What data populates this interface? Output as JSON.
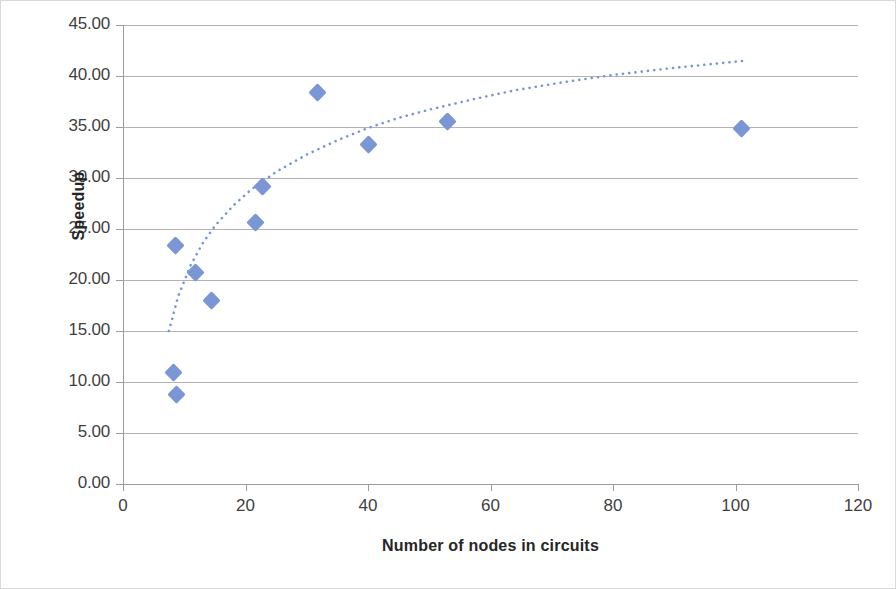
{
  "chart_data": {
    "type": "scatter",
    "title": "",
    "xlabel": "Number of nodes in circuits",
    "ylabel": "Speedup",
    "xlim": [
      0,
      120
    ],
    "ylim": [
      0,
      45
    ],
    "x_ticks": [
      "0",
      "20",
      "40",
      "60",
      "80",
      "100",
      "120"
    ],
    "x_tick_values": [
      0,
      20,
      40,
      60,
      80,
      100,
      120
    ],
    "y_ticks": [
      "0.00",
      "5.00",
      "10.00",
      "15.00",
      "20.00",
      "25.00",
      "30.00",
      "35.00",
      "40.00",
      "45.00"
    ],
    "y_tick_values": [
      0,
      5,
      10,
      15,
      20,
      25,
      30,
      35,
      40,
      45
    ],
    "grid": "horizontal",
    "legend": "none",
    "marker_color": "#7b96d4",
    "trendline_color": "#7b96d4",
    "trendline_style": "dotted",
    "trendline_type": "logarithmic",
    "points": [
      {
        "x": 8.2,
        "y": 10.9
      },
      {
        "x": 8.8,
        "y": 8.8
      },
      {
        "x": 8.6,
        "y": 23.4
      },
      {
        "x": 11.9,
        "y": 20.7
      },
      {
        "x": 14.4,
        "y": 18.0
      },
      {
        "x": 21.7,
        "y": 25.6
      },
      {
        "x": 22.8,
        "y": 29.2
      },
      {
        "x": 31.8,
        "y": 38.4
      },
      {
        "x": 40.0,
        "y": 33.3
      },
      {
        "x": 53.0,
        "y": 35.5
      },
      {
        "x": 101.0,
        "y": 34.9
      }
    ],
    "trendline": [
      {
        "x": 7.5,
        "y": 15.0
      },
      {
        "x": 9.0,
        "y": 18.4
      },
      {
        "x": 11.0,
        "y": 21.4
      },
      {
        "x": 13.0,
        "y": 23.6
      },
      {
        "x": 15.0,
        "y": 25.3
      },
      {
        "x": 18.0,
        "y": 27.3
      },
      {
        "x": 21.0,
        "y": 28.9
      },
      {
        "x": 25.0,
        "y": 30.6
      },
      {
        "x": 30.0,
        "y": 32.3
      },
      {
        "x": 35.0,
        "y": 33.7
      },
      {
        "x": 40.0,
        "y": 34.9
      },
      {
        "x": 45.0,
        "y": 35.9
      },
      {
        "x": 50.0,
        "y": 36.7
      },
      {
        "x": 57.0,
        "y": 37.7
      },
      {
        "x": 64.0,
        "y": 38.6
      },
      {
        "x": 72.0,
        "y": 39.4
      },
      {
        "x": 80.0,
        "y": 40.1
      },
      {
        "x": 90.0,
        "y": 40.8
      },
      {
        "x": 101.6,
        "y": 41.5
      }
    ]
  }
}
